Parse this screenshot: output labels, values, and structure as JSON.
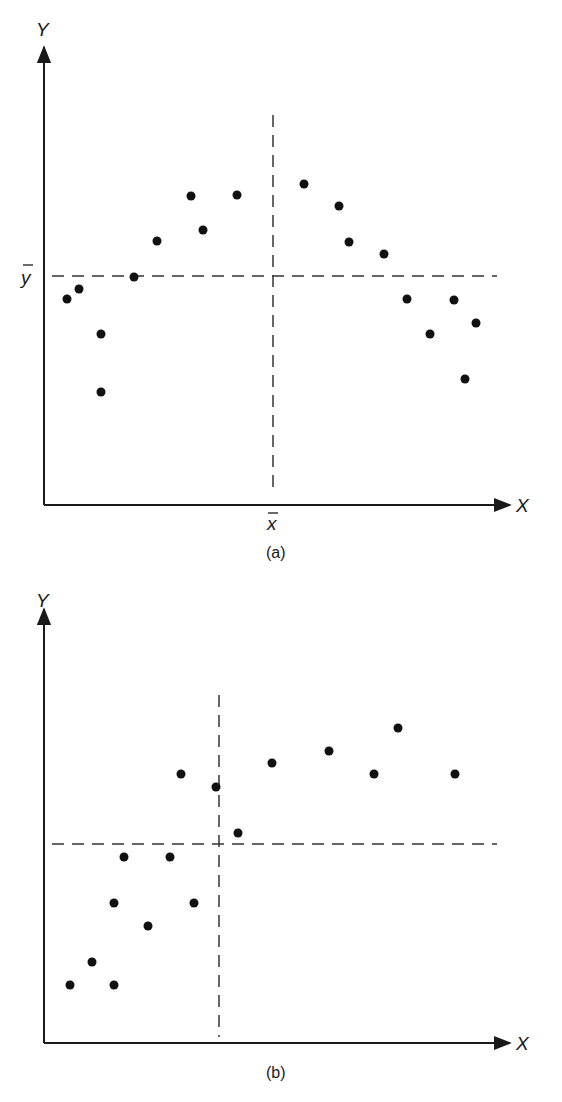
{
  "chart_data": [
    {
      "type": "scatter",
      "panel": "a",
      "caption": "(a)",
      "title": "",
      "xlabel": "X",
      "ylabel": "Y",
      "mean_labels": {
        "x": "x̄",
        "y": "ȳ"
      },
      "mean_lines": {
        "x_mean_px": 273,
        "y_mean_px": 276
      },
      "grid": false,
      "legend": null,
      "pixel_frame": {
        "origin_x": 44,
        "origin_y": 505,
        "x_end": 508,
        "y_top": 50
      },
      "points_px": [
        [
          67,
          299
        ],
        [
          79,
          289
        ],
        [
          101,
          334
        ],
        [
          101,
          392
        ],
        [
          134,
          277
        ],
        [
          157,
          241
        ],
        [
          191,
          196
        ],
        [
          203,
          230
        ],
        [
          237,
          195
        ],
        [
          304,
          184
        ],
        [
          339,
          206
        ],
        [
          349,
          242
        ],
        [
          384,
          254
        ],
        [
          407,
          299
        ],
        [
          430,
          334
        ],
        [
          454,
          300
        ],
        [
          465,
          379
        ],
        [
          476,
          323
        ]
      ],
      "description": "Inverted-U (parabolic) relationship; points rise then fall around the mean lines, giving near-zero covariance."
    },
    {
      "type": "scatter",
      "panel": "b",
      "caption": "(b)",
      "title": "",
      "xlabel": "X",
      "ylabel": "Y",
      "mean_labels": {
        "x": "",
        "y": ""
      },
      "mean_lines": {
        "x_mean_px": 219,
        "y_mean_px": 844
      },
      "grid": false,
      "legend": null,
      "pixel_frame": {
        "origin_x": 44,
        "origin_y": 1043,
        "x_end": 508,
        "y_top": 612
      },
      "points_px": [
        [
          70,
          985
        ],
        [
          92,
          962
        ],
        [
          114,
          985
        ],
        [
          114,
          903
        ],
        [
          124,
          857
        ],
        [
          148,
          926
        ],
        [
          170,
          857
        ],
        [
          194,
          903
        ],
        [
          181,
          774
        ],
        [
          216,
          787
        ],
        [
          238,
          833
        ],
        [
          272,
          763
        ],
        [
          329,
          751
        ],
        [
          374,
          774
        ],
        [
          398,
          728
        ],
        [
          455,
          774
        ]
      ],
      "description": "Positive, concave (increasing then leveling) relationship; most points in lower-left and upper-right quadrants relative to the mean lines."
    }
  ],
  "labels": {
    "a": {
      "y_axis": "Y",
      "x_axis": "X",
      "y_mean": "y",
      "x_mean": "x",
      "caption": "(a)"
    },
    "b": {
      "y_axis": "Y",
      "x_axis": "X",
      "caption": "(b)"
    }
  }
}
